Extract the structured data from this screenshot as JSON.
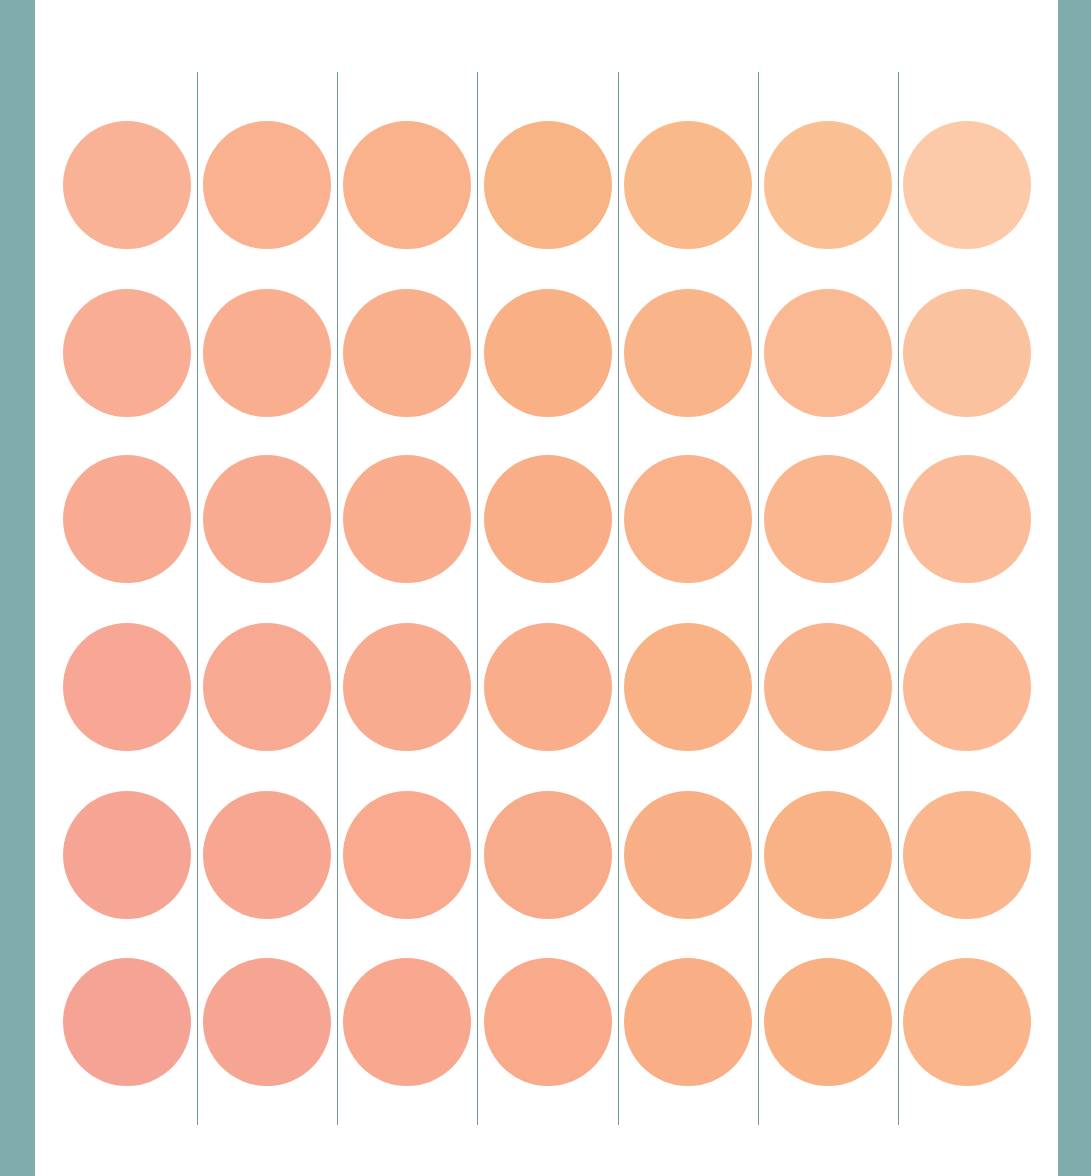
{
  "artwork": {
    "description": "Grid of 42 peach circles (7 columns x 6 rows) separated by thin vertical lines, framed by teal borders",
    "colors": {
      "frame": "#7fadab",
      "panel": "#ffffff",
      "line": "#6f9a9a"
    },
    "grid": {
      "columns": 7,
      "rows": 6,
      "circle_diameter": 128,
      "column_centers": [
        127,
        267,
        407,
        548,
        688,
        828,
        967
      ],
      "row_centers": [
        185,
        353,
        519,
        687,
        855,
        1022
      ]
    },
    "divider_lines": {
      "x": [
        197,
        337,
        477,
        618,
        758,
        898
      ],
      "top": 72,
      "bottom": 1125
    },
    "circle_colors": [
      [
        "#f9b295",
        "#f9b190",
        "#f9b28c",
        "#f9b486",
        "#fab98a",
        "#fbbf94",
        "#fccaa8"
      ],
      [
        "#f8ad94",
        "#f9ae90",
        "#f9af8c",
        "#f9b085",
        "#fab48a",
        "#fab992",
        "#fbc29f"
      ],
      [
        "#f8aa93",
        "#f8ab90",
        "#f9ad8d",
        "#f9ae88",
        "#f9b289",
        "#fab68f",
        "#fbbd99"
      ],
      [
        "#f7a793",
        "#f8a991",
        "#f8ab8e",
        "#f9ad8a",
        "#f9b186",
        "#fab48d",
        "#fbba95"
      ],
      [
        "#f6a595",
        "#f7a791",
        "#f8a98e",
        "#f8ab8a",
        "#f9af85",
        "#f9b285",
        "#fab78d"
      ],
      [
        "#f5a394",
        "#f6a592",
        "#f7a88f",
        "#f8aa8b",
        "#f9ae86",
        "#f9b184",
        "#fab58a"
      ]
    ]
  }
}
